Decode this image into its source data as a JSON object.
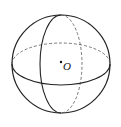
{
  "diagram": {
    "center_label": "O",
    "stroke_color": "#222222",
    "sphere": {
      "cx": 61,
      "cy": 64,
      "r": 49
    },
    "equator": {
      "cx": 61,
      "cy": 64,
      "rx": 49,
      "ry": 21
    },
    "meridian": {
      "cx": 61,
      "cy": 64,
      "rx": 21,
      "ry": 49
    },
    "center_dot": {
      "x": 61,
      "y": 62
    }
  }
}
